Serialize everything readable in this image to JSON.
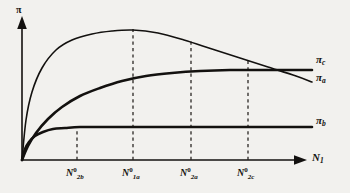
{
  "chart_data": {
    "type": "line",
    "title": "",
    "subtitle": "",
    "xlabel": "N_1",
    "ylabel": "pi",
    "grid": false,
    "legend_position": "right-of-curve-ends",
    "xlim": [
      0,
      330
    ],
    "ylim": [
      0,
      1
    ],
    "axis_symbols": {
      "y": "π",
      "x_base": "N",
      "x_sub": "1"
    },
    "annotations": {
      "dashed_vertical_lines": true,
      "arrow_heads": [
        "x-axis",
        "y-axis"
      ]
    },
    "x_ticks": [
      {
        "base": "N",
        "sup": "0",
        "sub": "2b",
        "x_px": 77
      },
      {
        "base": "N",
        "sup": "0",
        "sub": "1a",
        "x_px": 133
      },
      {
        "base": "N",
        "sup": "0",
        "sub": "2a",
        "x_px": 191
      },
      {
        "base": "N",
        "sup": "0",
        "sub": "2c",
        "x_px": 248
      }
    ],
    "series": [
      {
        "name": "pi_a",
        "label_base": "π",
        "label_sub": "a",
        "description": "rises steeply, peaks at N_1a^0, then declines",
        "peak_x_px": 133,
        "points": [
          [
            22,
            160
          ],
          [
            26,
            120
          ],
          [
            32,
            92
          ],
          [
            42,
            68
          ],
          [
            56,
            50
          ],
          [
            72,
            40
          ],
          [
            92,
            34
          ],
          [
            112,
            31
          ],
          [
            133,
            30
          ],
          [
            158,
            33
          ],
          [
            184,
            40
          ],
          [
            212,
            49
          ],
          [
            240,
            58
          ],
          [
            268,
            67
          ],
          [
            296,
            76
          ],
          [
            312,
            82
          ]
        ]
      },
      {
        "name": "pi_b",
        "label_base": "π",
        "label_sub": "b",
        "description": "rises steeply and saturates at a low plateau",
        "plateau_y_px": 127,
        "points": [
          [
            22,
            160
          ],
          [
            25,
            149
          ],
          [
            29,
            142
          ],
          [
            35,
            136
          ],
          [
            43,
            132
          ],
          [
            53,
            129
          ],
          [
            65,
            128
          ],
          [
            80,
            127
          ],
          [
            110,
            127
          ],
          [
            160,
            127
          ],
          [
            220,
            127
          ],
          [
            280,
            127
          ],
          [
            312,
            127
          ]
        ]
      },
      {
        "name": "pi_c",
        "label_base": "π",
        "label_sub": "c",
        "description": "rises gradually and saturates at a high plateau",
        "plateau_y_px": 70,
        "points": [
          [
            22,
            160
          ],
          [
            28,
            146
          ],
          [
            36,
            133
          ],
          [
            48,
            119
          ],
          [
            62,
            107
          ],
          [
            80,
            96
          ],
          [
            100,
            88
          ],
          [
            122,
            81
          ],
          [
            146,
            76
          ],
          [
            172,
            73
          ],
          [
            200,
            71
          ],
          [
            230,
            70
          ],
          [
            260,
            70
          ],
          [
            290,
            70
          ],
          [
            312,
            70
          ]
        ]
      }
    ]
  },
  "curve_labels": [
    {
      "base": "π",
      "sub": "c",
      "x_px": 316,
      "y_px": 60
    },
    {
      "base": "π",
      "sub": "a",
      "x_px": 316,
      "y_px": 78
    },
    {
      "base": "π",
      "sub": "b",
      "x_px": 316,
      "y_px": 121
    }
  ],
  "colors": {
    "background": "#f2f1ee",
    "ink": "#13110f",
    "curve": "#13110f",
    "dashed": "#2a2724"
  }
}
